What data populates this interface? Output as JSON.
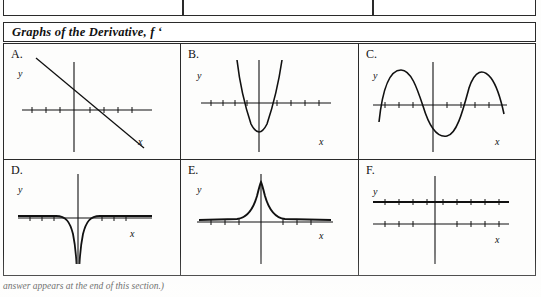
{
  "document": {
    "section_heading": "Graphs of the Derivative, f ‘",
    "footer_note": "answer appears at the end of this section.)"
  },
  "top_fragment": {
    "cells": [
      {
        "text": ""
      },
      {
        "text": ""
      },
      {
        "text": ""
      }
    ]
  },
  "graphs": {
    "axis_labels": {
      "x": "x",
      "y": "y"
    },
    "items": [
      {
        "label": "A.",
        "shape": "line-decreasing",
        "description": "Straight line with negative slope crossing both axes; tick marks on x-axis"
      },
      {
        "label": "B.",
        "shape": "parabola-up",
        "description": "Upward opening parabola with vertex below the x-axis, narrow"
      },
      {
        "label": "C.",
        "shape": "sinusoid",
        "description": "Wave with two peaks above the x-axis and one trough between, crossing the axis"
      },
      {
        "label": "D.",
        "shape": "negative-reciprocal-squared",
        "description": "Curve with vertical asymptote at the y-axis dipping sharply downward on both sides"
      },
      {
        "label": "E.",
        "shape": "bell-peak",
        "description": "Sharp single peak centered at the y-axis with flat tails along the x-axis"
      },
      {
        "label": "F.",
        "shape": "horizontal-lines",
        "description": "Two horizontal lines, one above the x-axis with tick marks and one along the x-axis"
      }
    ]
  }
}
